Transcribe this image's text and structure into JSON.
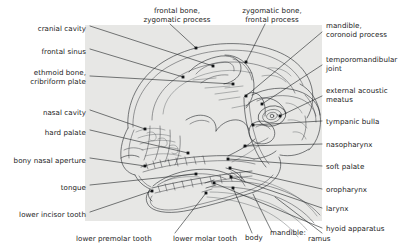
{
  "figure": {
    "panel_color": "#e7e7e5",
    "line_color": "#2b2e31",
    "text_color": "#1a1a1a",
    "label_font_size_px": 7.1
  },
  "labels": {
    "left": [
      {
        "id": "cranial-cavity",
        "text": "cranial cavity",
        "x": 86,
        "y": 29,
        "align": "end",
        "lines": [
          "cranial cavity"
        ],
        "leader": [
          [
            90,
            26
          ],
          [
            213,
            66
          ]
        ],
        "dot": [
          213,
          66
        ]
      },
      {
        "id": "frontal-sinus",
        "text": "frontal sinus",
        "x": 86,
        "y": 52,
        "align": "end",
        "lines": [
          "frontal sinus"
        ],
        "leader": [
          [
            90,
            49
          ],
          [
            183,
            77
          ]
        ],
        "dot": [
          183,
          77
        ]
      },
      {
        "id": "ethmoid-bone",
        "text": "ethmoid bone, cribriform plate",
        "x": 86,
        "y": 76,
        "align": "end",
        "lines": [
          "ethmoid bone,",
          "cribriform plate"
        ],
        "leader": [
          [
            90,
            76
          ],
          [
            233,
            84
          ]
        ],
        "dot": [
          233,
          84
        ]
      },
      {
        "id": "nasal-cavity",
        "text": "nasal cavity",
        "x": 86,
        "y": 113,
        "align": "end",
        "lines": [
          "nasal cavity"
        ],
        "leader": [
          [
            90,
            110
          ],
          [
            145,
            129
          ]
        ],
        "dot": [
          145,
          129
        ]
      },
      {
        "id": "hard-palate",
        "text": "hard palate",
        "x": 86,
        "y": 133,
        "align": "end",
        "lines": [
          "hard palate"
        ],
        "leader": [
          [
            90,
            130
          ],
          [
            188,
            153
          ]
        ],
        "dot": [
          188,
          153
        ]
      },
      {
        "id": "bony-nasal-aperture",
        "text": "bony nasal aperture",
        "x": 86,
        "y": 161,
        "align": "end",
        "lines": [
          "bony nasal aperture"
        ],
        "leader": [
          [
            90,
            158
          ],
          [
            145,
            166
          ]
        ],
        "dot": [
          145,
          166
        ]
      },
      {
        "id": "tongue",
        "text": "tongue",
        "x": 86,
        "y": 188,
        "align": "end",
        "lines": [
          "tongue"
        ],
        "leader": [
          [
            90,
            185
          ],
          [
            196,
            174
          ]
        ],
        "dot": [
          196,
          174
        ]
      },
      {
        "id": "lower-incisor-tooth",
        "text": "lower incisor tooth",
        "x": 86,
        "y": 215,
        "align": "end",
        "lines": [
          "lower incisor tooth"
        ],
        "leader": [
          [
            90,
            212
          ],
          [
            152,
            191
          ]
        ],
        "dot": [
          152,
          191
        ]
      }
    ],
    "top": [
      {
        "id": "frontal-bone-zygomatic-process",
        "text": "frontal bone, zygomatic process",
        "x": 177,
        "y": 11,
        "align": "middle",
        "lines": [
          "frontal bone,",
          "zygomatic process"
        ],
        "leader": [
          [
            170,
            24
          ],
          [
            196,
            48
          ]
        ],
        "dot": [
          196,
          48
        ]
      },
      {
        "id": "zygomatic-bone-frontal-process",
        "text": "zygomatic bone, frontal process",
        "x": 272,
        "y": 11,
        "align": "middle",
        "lines": [
          "zygomatic bone,",
          "frontal process"
        ],
        "leader": [
          [
            265,
            24
          ],
          [
            246,
            62
          ]
        ],
        "dot": [
          246,
          62
        ]
      }
    ],
    "right": [
      {
        "id": "mandible-coronoid-process",
        "text": "mandible, coronoid process",
        "x": 326,
        "y": 29,
        "align": "start",
        "lines": [
          "mandible,",
          "coronoid process"
        ],
        "leader": [
          [
            322,
            32
          ],
          [
            246,
            96
          ]
        ],
        "dot": [
          246,
          96
        ]
      },
      {
        "id": "temporomandibular-joint",
        "text": "temporomandibular joint",
        "x": 326,
        "y": 62,
        "align": "start",
        "lines": [
          "temporomandibular",
          "joint"
        ],
        "leader": [
          [
            322,
            65
          ],
          [
            262,
            104
          ]
        ],
        "dot": [
          262,
          104
        ]
      },
      {
        "id": "external-acoustic-meatus",
        "text": "external acoustic meatus",
        "x": 326,
        "y": 93,
        "align": "start",
        "lines": [
          "external acoustic",
          "meatus"
        ],
        "leader": [
          [
            322,
            96
          ],
          [
            280,
            116
          ]
        ],
        "dot": [
          280,
          116
        ]
      },
      {
        "id": "tympanic-bulla",
        "text": "tympanic bulla",
        "x": 326,
        "y": 124,
        "align": "start",
        "lines": [
          "tympanic bulla"
        ],
        "leader": [
          [
            322,
            121
          ],
          [
            253,
            125
          ]
        ],
        "dot": [
          253,
          125
        ]
      },
      {
        "id": "nasopharynx",
        "text": "nasopharynx",
        "x": 326,
        "y": 147,
        "align": "start",
        "lines": [
          "nasopharynx"
        ],
        "leader": [
          [
            322,
            144
          ],
          [
            245,
            146
          ]
        ],
        "dot": [
          245,
          146
        ]
      },
      {
        "id": "soft-palate",
        "text": "soft palate",
        "x": 326,
        "y": 169,
        "align": "start",
        "lines": [
          "soft palate"
        ],
        "leader": [
          [
            322,
            166
          ],
          [
            228,
            159
          ]
        ],
        "dot": [
          228,
          159
        ]
      },
      {
        "id": "oropharynx",
        "text": "oropharynx",
        "x": 326,
        "y": 192,
        "align": "start",
        "lines": [
          "oropharynx"
        ],
        "leader": [
          [
            322,
            189
          ],
          [
            230,
            168
          ]
        ],
        "dot": [
          230,
          168
        ]
      },
      {
        "id": "larynx",
        "text": "larynx",
        "x": 326,
        "y": 211,
        "align": "start",
        "lines": [
          "larynx"
        ],
        "leader": [
          [
            322,
            208
          ],
          [
            231,
            177
          ]
        ],
        "dot": [
          231,
          177
        ]
      },
      {
        "id": "hyoid-apparatus",
        "text": "hyoid apparatus",
        "x": 326,
        "y": 231,
        "align": "start",
        "lines": [
          "hyoid apparatus"
        ],
        "leader": [
          [
            322,
            228
          ],
          [
            214,
            183
          ]
        ],
        "dot": [
          214,
          183
        ]
      }
    ],
    "bottom": [
      {
        "id": "lower-premolar-tooth",
        "text": "lower premolar tooth",
        "x": 121,
        "y": 240,
        "align": "start",
        "lines": [
          "lower premolar tooth"
        ],
        "leader": [
          [
            175,
            233
          ],
          [
            206,
            193
          ]
        ],
        "dot": [
          206,
          193
        ]
      },
      {
        "id": "lower-molar-tooth",
        "text": "lower molar tooth",
        "x": 218,
        "y": 240,
        "align": "start",
        "lines": [
          "lower molar tooth"
        ],
        "leader": [
          [
            252,
            233
          ],
          [
            233,
            188
          ]
        ],
        "dot": [
          233,
          188
        ]
      },
      {
        "id": "body",
        "text": "body",
        "x": 264,
        "y": 239,
        "align": "start",
        "lines": [
          "body"
        ],
        "leader": [
          [
            272,
            232
          ],
          [
            253,
            194
          ]
        ],
        "dot": null
      },
      {
        "id": "mandible",
        "text": "mandible:",
        "x": 287,
        "y": 235,
        "align": "start",
        "lines": [
          "mandible:"
        ],
        "leader": null,
        "dot": null
      },
      {
        "id": "ramus",
        "text": "ramus",
        "x": 318,
        "y": 241,
        "align": "start",
        "lines": [
          "ramus"
        ],
        "leader": [
          [
            322,
            233
          ],
          [
            275,
            197
          ]
        ],
        "dot": null
      }
    ]
  }
}
